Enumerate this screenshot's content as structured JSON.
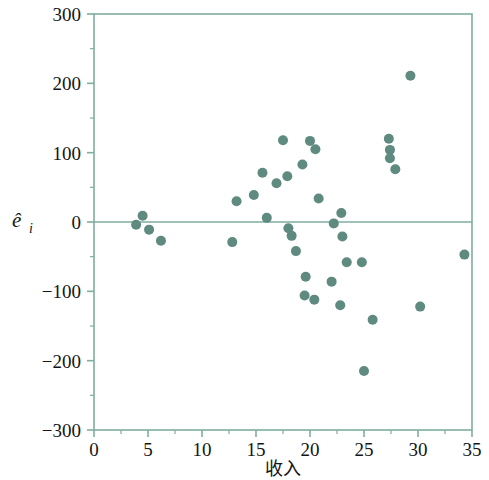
{
  "chart_data": {
    "type": "scatter",
    "title": "",
    "xlabel": "收入",
    "ylabel": "êᵢ",
    "ylabel_base": "ê",
    "ylabel_sub": "i",
    "xlim": [
      0,
      35
    ],
    "ylim": [
      -300,
      300
    ],
    "xticks": [
      0,
      5,
      10,
      15,
      20,
      25,
      30,
      35
    ],
    "yticks": [
      300,
      200,
      100,
      0,
      -100,
      -200,
      -300
    ],
    "xtick_labels": [
      "0",
      "5",
      "10",
      "15",
      "20",
      "25",
      "30",
      "35"
    ],
    "ytick_labels": [
      "300",
      "200",
      "100",
      "0",
      "−100",
      "−200",
      "−300"
    ],
    "grid": false,
    "zero_line": true,
    "legend": null,
    "marker_color": "#5f8a80",
    "axis_color": "#7fae9f",
    "marker_size": 5,
    "points": [
      {
        "x": 3.9,
        "y": -4
      },
      {
        "x": 4.5,
        "y": 9
      },
      {
        "x": 5.1,
        "y": -11
      },
      {
        "x": 6.2,
        "y": -27
      },
      {
        "x": 12.8,
        "y": -29
      },
      {
        "x": 13.2,
        "y": 30
      },
      {
        "x": 14.8,
        "y": 39
      },
      {
        "x": 15.6,
        "y": 71
      },
      {
        "x": 16.0,
        "y": 6
      },
      {
        "x": 16.9,
        "y": 56
      },
      {
        "x": 17.5,
        "y": 118
      },
      {
        "x": 17.9,
        "y": 66
      },
      {
        "x": 18.0,
        "y": -9
      },
      {
        "x": 18.3,
        "y": -20
      },
      {
        "x": 18.7,
        "y": -42
      },
      {
        "x": 19.3,
        "y": 83
      },
      {
        "x": 20.0,
        "y": 117
      },
      {
        "x": 20.5,
        "y": 105
      },
      {
        "x": 20.8,
        "y": 34
      },
      {
        "x": 19.6,
        "y": -79
      },
      {
        "x": 19.5,
        "y": -106
      },
      {
        "x": 20.4,
        "y": -112
      },
      {
        "x": 22.0,
        "y": -86
      },
      {
        "x": 22.8,
        "y": -120
      },
      {
        "x": 23.0,
        "y": -21
      },
      {
        "x": 23.4,
        "y": -58
      },
      {
        "x": 22.9,
        "y": 13
      },
      {
        "x": 22.2,
        "y": -2
      },
      {
        "x": 24.8,
        "y": -58
      },
      {
        "x": 25.0,
        "y": -215
      },
      {
        "x": 25.8,
        "y": -141
      },
      {
        "x": 27.3,
        "y": 120
      },
      {
        "x": 27.4,
        "y": 104
      },
      {
        "x": 27.4,
        "y": 92
      },
      {
        "x": 27.9,
        "y": 76
      },
      {
        "x": 29.3,
        "y": 211
      },
      {
        "x": 30.2,
        "y": -122
      },
      {
        "x": 34.3,
        "y": -47
      }
    ]
  },
  "axes": {
    "x_axis_name": "收入",
    "y_axis_name": "êᵢ"
  }
}
